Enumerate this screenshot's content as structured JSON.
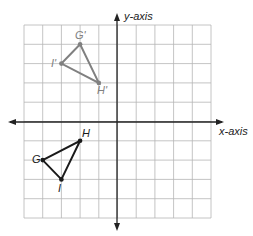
{
  "diagram": {
    "type": "coordinate-plane-reflection",
    "axes": {
      "x_label": "x-axis",
      "y_label": "y-axis"
    },
    "grid": {
      "x_min": -5,
      "x_max": 5,
      "y_min": -5,
      "y_max": 5,
      "step": 1
    },
    "original": {
      "color": "#1a1a1a",
      "points": [
        {
          "name": "G",
          "x": -4,
          "y": -2
        },
        {
          "name": "H",
          "x": -2,
          "y": -1
        },
        {
          "name": "I",
          "x": -3,
          "y": -3
        }
      ]
    },
    "image": {
      "color": "#808080",
      "points": [
        {
          "name": "G'",
          "x": -2,
          "y": 4
        },
        {
          "name": "H'",
          "x": -1,
          "y": 2
        },
        {
          "name": "I'",
          "x": -3,
          "y": 3
        }
      ]
    }
  }
}
